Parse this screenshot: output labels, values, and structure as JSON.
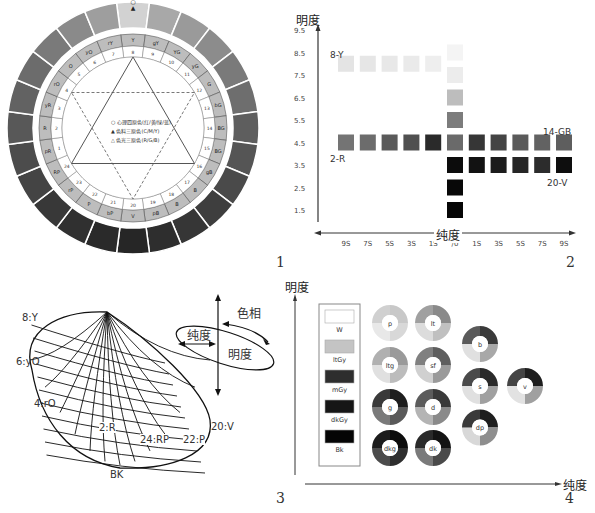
{
  "figure_numbers": [
    "1",
    "2",
    "3",
    "4"
  ],
  "fig1": {
    "title": "PCCS Hue Circle",
    "hues_clockwise_from_top": [
      {
        "num": "8",
        "code": "Y"
      },
      {
        "num": "9",
        "code": "gY"
      },
      {
        "num": "10",
        "code": "YG"
      },
      {
        "num": "11",
        "code": "yG"
      },
      {
        "num": "12",
        "code": "G"
      },
      {
        "num": "13",
        "code": "bG"
      },
      {
        "num": "14",
        "code": "BG"
      },
      {
        "num": "15",
        "code": "BG"
      },
      {
        "num": "16",
        "code": "gB"
      },
      {
        "num": "17",
        "code": "B"
      },
      {
        "num": "18",
        "code": "B"
      },
      {
        "num": "19",
        "code": "pB"
      },
      {
        "num": "20",
        "code": "V"
      },
      {
        "num": "21",
        "code": "bP"
      },
      {
        "num": "22",
        "code": "P"
      },
      {
        "num": "23",
        "code": "rP"
      },
      {
        "num": "24",
        "code": "RP"
      },
      {
        "num": "1",
        "code": "pR"
      },
      {
        "num": "2",
        "code": "R"
      },
      {
        "num": "3",
        "code": "yR"
      },
      {
        "num": "4",
        "code": "rO"
      },
      {
        "num": "5",
        "code": "O"
      },
      {
        "num": "6",
        "code": "yO"
      },
      {
        "num": "7",
        "code": "rY"
      }
    ],
    "outer_ring_grays": [
      "#d2d2d2",
      "#a8a8a8",
      "#9a9a9a",
      "#8c8c8c",
      "#7a7a7a",
      "#6e6e6e",
      "#5e5e5e",
      "#555",
      "#4a4a4a",
      "#3e3e3e",
      "#363636",
      "#2e2e2e",
      "#262626",
      "#2a2a2a",
      "#303030",
      "#383838",
      "#444",
      "#4c4c4c",
      "#585858",
      "#626262",
      "#6c6c6c",
      "#7a7a7a",
      "#8a8a8a",
      "#9e9e9e"
    ],
    "legend": [
      {
        "symbol": "○",
        "text": "心理四原色(红/黄/绿/蓝)"
      },
      {
        "symbol": "▲",
        "text": "色料三原色(C/M/Y)"
      },
      {
        "symbol": "△",
        "text": "色光三原色(R/G/B)"
      }
    ]
  },
  "chart_data": [
    {
      "type": "table",
      "title": "PCCS hue section (2-R / 14-GB, 8-Y / 20-V)",
      "ylabel": "明度",
      "xlabel": "纯度",
      "y_ticks": [
        "9.5",
        "8.5",
        "7.5",
        "6.5",
        "5.5",
        "4.5",
        "3.5",
        "2.5",
        "1.5"
      ],
      "x_ticks": [
        "9S",
        "7S",
        "5S",
        "3S",
        "1S",
        "/0",
        "1S",
        "3S",
        "5S",
        "7S",
        "9S"
      ],
      "annotations": [
        "8-Y",
        "2-R",
        "14-GB",
        "20-V"
      ],
      "neutral_column": [
        {
          "value": 8.5,
          "color": "#f4f4f4"
        },
        {
          "value": 7.5,
          "color": "#ececec"
        },
        {
          "value": 6.5,
          "color": "#bdbdbd"
        },
        {
          "value": 5.5,
          "color": "#7c7c7c"
        },
        {
          "value": 4.5,
          "color": "#6a6a6a"
        },
        {
          "value": 3.5,
          "color": "#0c0c0c"
        },
        {
          "value": 2.5,
          "color": "#080808"
        },
        {
          "value": 1.5,
          "color": "#060606"
        }
      ],
      "series": [
        {
          "name": "8-Y",
          "row_value": 8.0,
          "positions": [
            "9S",
            "7S",
            "5S",
            "3S",
            "1S"
          ],
          "colors": [
            "#e4e4e4",
            "#e6e6e6",
            "#e8e8e8",
            "#eaeaea",
            "#eeeeee"
          ]
        },
        {
          "name": "2-R",
          "row_value": 4.5,
          "positions": [
            "9S",
            "7S",
            "5S",
            "3S",
            "1S"
          ],
          "colors": [
            "#747474",
            "#6c6c6c",
            "#5a5a5a",
            "#505050",
            "#2a2a2a"
          ]
        },
        {
          "name": "14-GB",
          "row_value": 4.5,
          "positions": [
            "1S",
            "3S",
            "5S",
            "7S",
            "9S"
          ],
          "colors": [
            "#363636",
            "#444444",
            "#5a5a5a",
            "#626262",
            "#5e5e5e"
          ]
        },
        {
          "name": "20-V",
          "row_value": 3.5,
          "positions": [
            "1S",
            "3S",
            "5S",
            "7S",
            "9S"
          ],
          "colors": [
            "#121212",
            "#1c1c1c",
            "#262626",
            "#2c2c2c",
            "#0e0e0e"
          ]
        }
      ]
    },
    {
      "type": "scatter",
      "title": "PCCS tone map",
      "ylabel": "明度",
      "xlabel": "纯度",
      "neutral_legend": [
        {
          "label": "W",
          "color": "#ffffff"
        },
        {
          "label": "ltGy",
          "color": "#c4c4c4"
        },
        {
          "label": "mGy",
          "color": "#2e2e2e"
        },
        {
          "label": "dkGy",
          "color": "#161616"
        },
        {
          "label": "Bk",
          "color": "#050505"
        }
      ],
      "tones": [
        {
          "label": "p",
          "col": 0,
          "row": 0,
          "colors": [
            "#c8c8c8",
            "#d8d8d8",
            "#e8e8e8",
            "#d0d0d0"
          ]
        },
        {
          "label": "lt",
          "col": 1,
          "row": 0,
          "colors": [
            "#8a8a8a",
            "#c0c0c0",
            "#dcdcdc",
            "#a0a0a0"
          ]
        },
        {
          "label": "ltg",
          "col": 0,
          "row": 1,
          "colors": [
            "#9a9a9a",
            "#bcbcbc",
            "#e0e0e0",
            "#b0b0b0"
          ]
        },
        {
          "label": "sf",
          "col": 1,
          "row": 1,
          "colors": [
            "#5e5e5e",
            "#9a9a9a",
            "#d0d0d0",
            "#808080"
          ]
        },
        {
          "label": "g",
          "col": 0,
          "row": 2,
          "colors": [
            "#1e1e1e",
            "#5a5a5a",
            "#7a7a7a",
            "#3a3a3a"
          ]
        },
        {
          "label": "d",
          "col": 1,
          "row": 2,
          "colors": [
            "#3a3a3a",
            "#8a8a8a",
            "#b4b4b4",
            "#5c5c5c"
          ]
        },
        {
          "label": "dkg",
          "col": 0,
          "row": 3,
          "colors": [
            "#0c0c0c",
            "#2e2e2e",
            "#4c4c4c",
            "#1c1c1c"
          ]
        },
        {
          "label": "dk",
          "col": 1,
          "row": 3,
          "colors": [
            "#141414",
            "#4a4a4a",
            "#7a7a7a",
            "#2a2a2a"
          ]
        },
        {
          "label": "b",
          "col": 2,
          "row": 0.5,
          "colors": [
            "#3a3a3a",
            "#a8a8a8",
            "#e0e0e0",
            "#5a5a5a"
          ]
        },
        {
          "label": "s",
          "col": 2,
          "row": 1.5,
          "colors": [
            "#2a2a2a",
            "#a0a0a0",
            "#e0e0e0",
            "#4a4a4a"
          ]
        },
        {
          "label": "v",
          "col": 3,
          "row": 1.5,
          "colors": [
            "#1e1e1e",
            "#a0a0a0",
            "#e2e2e2",
            "#444444"
          ]
        },
        {
          "label": "dp",
          "col": 2,
          "row": 2.5,
          "colors": [
            "#1e1e1e",
            "#8e8e8e",
            "#d8d8d8",
            "#3a3a3a"
          ]
        }
      ]
    }
  ],
  "fig3": {
    "hue_labels": [
      "8:Y",
      "6:yO",
      "4:rO",
      "2:R",
      "24:RP",
      "22:P",
      "20:V"
    ],
    "bottom_label": "BK",
    "axis_legend": {
      "hue": "色相",
      "chroma": "纯度",
      "value": "明度"
    }
  }
}
